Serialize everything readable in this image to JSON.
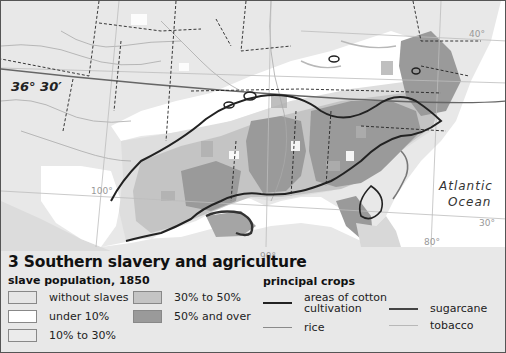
{
  "map": {
    "title": "3 Southern slavery and agriculture",
    "subtitle": "slave population, 1850",
    "latitude_label": "36° 30′",
    "ocean_label_line1": "Atlantic",
    "ocean_label_line2": "Ocean",
    "graticule_labels": {
      "lat_40": "40°",
      "lat_30": "30°",
      "lon_100": "100°",
      "lon_90": "90°",
      "lon_80": "80°"
    }
  },
  "legend": {
    "slave_population": [
      {
        "label": "without slaves",
        "color": "#e6e6e6"
      },
      {
        "label": "under 10%",
        "color": "#ffffff"
      },
      {
        "label": "10% to 30%",
        "color": "#ebebeb"
      },
      {
        "label": "30% to 50%",
        "color": "#c4c4c4"
      },
      {
        "label": "50% and over",
        "color": "#9a9a9a"
      }
    ],
    "crops_title": "principal crops",
    "crops": [
      {
        "label_line1": "areas of cotton",
        "label_line2": "cultivation",
        "color": "#222222",
        "width": 2
      },
      {
        "label": "rice",
        "color": "#8a8a8a",
        "width": 1.6
      },
      {
        "label": "sugarcane",
        "color": "#444444",
        "width": 2.4
      },
      {
        "label": "tobacco",
        "color": "#b8b8b8",
        "width": 1.4
      }
    ]
  }
}
